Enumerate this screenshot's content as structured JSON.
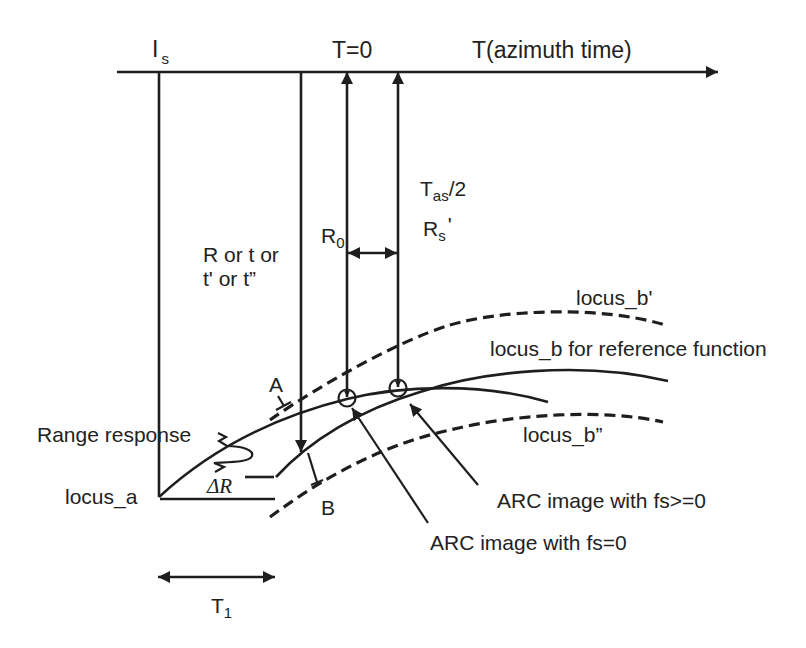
{
  "colors": {
    "ink": "#1e1e1e",
    "text": "#222222",
    "background": "#ffffff"
  },
  "axis": {
    "title": "T(azimuth time)",
    "t0_label": "T=0",
    "is_label": {
      "main": "I",
      "sub": "s"
    }
  },
  "range_axis": {
    "line1": "R or t or",
    "line2": "t' or t”"
  },
  "annotations": {
    "tas_half": {
      "main": "T",
      "sub": "as",
      "suffix": "/2"
    },
    "rs_prime": {
      "main": "R",
      "sub": "s",
      "suffix": "'"
    },
    "r0": {
      "main": "R",
      "sub": "0"
    },
    "point_a": "A",
    "point_b": "B",
    "range_response": "Range response",
    "delta_r": "ΔR",
    "t1": {
      "main": "T",
      "sub": "1"
    }
  },
  "loci": {
    "locus_a": "locus_a",
    "locus_b_prime": "locus_b'",
    "locus_b": "locus_b for reference function",
    "locus_b_double_prime": "locus_b”"
  },
  "callouts": {
    "arc_fs_ge0": "ARC image with fs>=0",
    "arc_fs0": "ARC image with fs=0"
  }
}
